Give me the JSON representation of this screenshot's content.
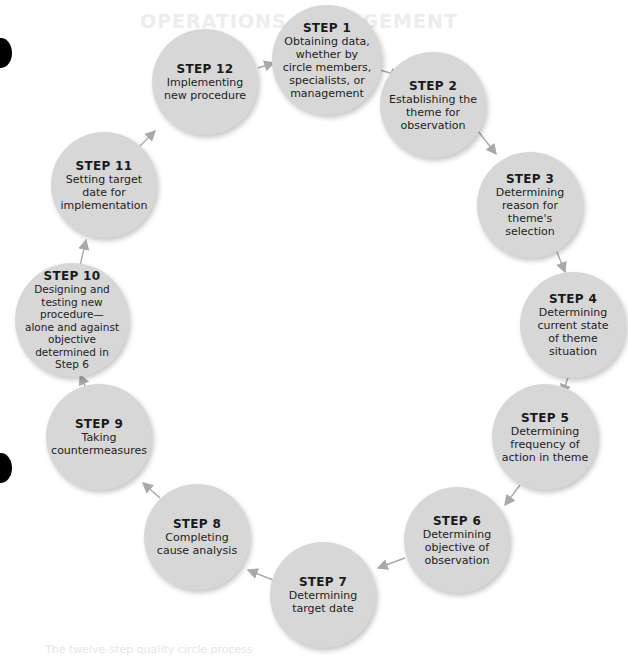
{
  "diagram": {
    "type": "cycle",
    "ghost_header": "OPERATIONS MANAGEMENT",
    "ghost_footer": "The twelve-step quality circle process",
    "steps": [
      {
        "title": "STEP 1",
        "desc": [
          "Obtaining data,",
          "whether by",
          "circle members,",
          "specialists, or",
          "management"
        ]
      },
      {
        "title": "STEP 2",
        "desc": [
          "Establishing the",
          "theme for",
          "observation"
        ]
      },
      {
        "title": "STEP 3",
        "desc": [
          "Determining",
          "reason for",
          "theme's selection"
        ]
      },
      {
        "title": "STEP 4",
        "desc": [
          "Determining",
          "current state",
          "of theme",
          "situation"
        ]
      },
      {
        "title": "STEP 5",
        "desc": [
          "Determining",
          "frequency of",
          "action in theme"
        ]
      },
      {
        "title": "STEP 6",
        "desc": [
          "Determining",
          "objective of",
          "observation"
        ]
      },
      {
        "title": "STEP 7",
        "desc": [
          "Determining",
          "target date"
        ]
      },
      {
        "title": "STEP 8",
        "desc": [
          "Completing",
          "cause analysis"
        ]
      },
      {
        "title": "STEP 9",
        "desc": [
          "Taking",
          "countermeasures"
        ]
      },
      {
        "title": "STEP 10",
        "desc": [
          "Designing and",
          "testing new",
          "procedure—",
          "alone and against",
          "objective",
          "determined in",
          "Step 6"
        ]
      },
      {
        "title": "STEP 11",
        "desc": [
          "Setting target",
          "date for",
          "implementation"
        ]
      },
      {
        "title": "STEP 12",
        "desc": [
          "Implementing",
          "new procedure"
        ]
      }
    ],
    "colors": {
      "circle_fill": "#d7d7d7",
      "arrow": "#a9a9a9",
      "text": "#1a1a1a"
    }
  }
}
